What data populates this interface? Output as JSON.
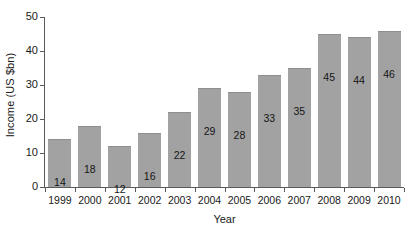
{
  "chart_data": {
    "type": "bar",
    "title": "",
    "xlabel": "Year",
    "ylabel": "Income (US $bn)",
    "categories": [
      "1999",
      "2000",
      "2001",
      "2002",
      "2003",
      "2004",
      "2005",
      "2006",
      "2007",
      "2008",
      "2009",
      "2010"
    ],
    "values": [
      14,
      18,
      12,
      16,
      22,
      29,
      28,
      33,
      35,
      45,
      44,
      46
    ],
    "data_labels": [
      "14",
      "18",
      "12",
      "16",
      "22",
      "29",
      "28",
      "33",
      "35",
      "45",
      "44",
      "46"
    ],
    "ylim": [
      0,
      50
    ],
    "yticks": [
      0,
      10,
      20,
      30,
      40,
      50
    ],
    "ytick_labels": [
      "0",
      "10",
      "20",
      "30",
      "40",
      "50"
    ],
    "grid": false,
    "legend": false,
    "legend_position": "none",
    "series_name": "Income",
    "bar_color": "#a2a2a2",
    "bar_edge_color": "#8e8e8e",
    "axis_color": "#5a5a5a",
    "text_color": "#1a1a1a",
    "background_color": "#ffffff"
  }
}
